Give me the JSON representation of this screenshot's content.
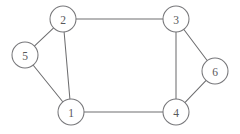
{
  "figure": {
    "title": "",
    "background_color": "#ffffff",
    "width": 240,
    "height": 134
  },
  "chart_data": {
    "type": "diagram",
    "diagram_kind": "undirected-graph",
    "title": "",
    "xlabel": "",
    "ylabel": "",
    "grid": false,
    "legend": null,
    "node_radius": 13,
    "node_fill": "#ffffff",
    "node_stroke": "#77777a",
    "edge_stroke": "#6e6e70",
    "label_color": "#58585b",
    "nodes": [
      {
        "id": "1",
        "label": "1",
        "x": 71,
        "y": 112
      },
      {
        "id": "2",
        "label": "2",
        "x": 63,
        "y": 19
      },
      {
        "id": "3",
        "label": "3",
        "x": 176,
        "y": 19
      },
      {
        "id": "4",
        "label": "4",
        "x": 176,
        "y": 112
      },
      {
        "id": "5",
        "label": "5",
        "x": 25,
        "y": 55
      },
      {
        "id": "6",
        "label": "6",
        "x": 215,
        "y": 71
      }
    ],
    "edges": [
      {
        "source": "2",
        "target": "3"
      },
      {
        "source": "2",
        "target": "1"
      },
      {
        "source": "2",
        "target": "5"
      },
      {
        "source": "5",
        "target": "1"
      },
      {
        "source": "1",
        "target": "4"
      },
      {
        "source": "3",
        "target": "4"
      },
      {
        "source": "3",
        "target": "6"
      },
      {
        "source": "6",
        "target": "4"
      }
    ],
    "node_count": 6,
    "edge_count": 8,
    "degrees": {
      "1": 3,
      "2": 3,
      "3": 3,
      "4": 3,
      "5": 2,
      "6": 2
    }
  }
}
